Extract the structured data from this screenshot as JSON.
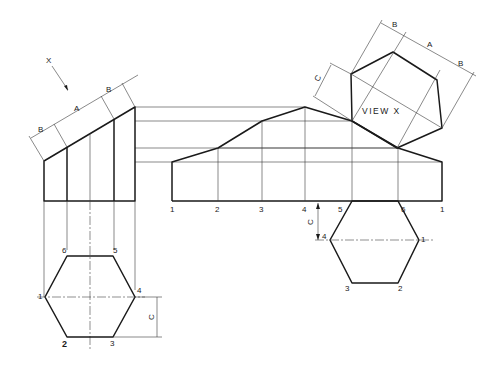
{
  "drawing": {
    "view_arrow_label": "X",
    "view_title": "VIEW X",
    "dimensions": {
      "a": "A",
      "b": "B",
      "c": "C"
    },
    "plan_points": [
      "1",
      "2",
      "3",
      "4",
      "5",
      "6"
    ],
    "development_points": [
      "1",
      "2",
      "3",
      "4",
      "5",
      "6",
      "1"
    ],
    "base_points": {
      "p4": "4",
      "p1": "1",
      "p3": "3",
      "p2": "2"
    }
  }
}
